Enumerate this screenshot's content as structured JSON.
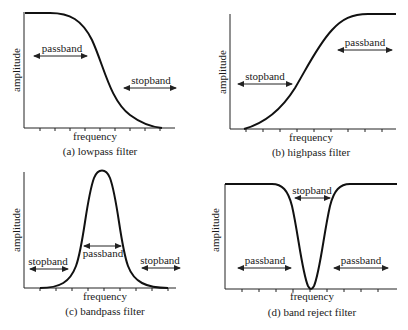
{
  "panels": [
    {
      "id": "a",
      "caption": "(a) lowpass filter",
      "xlabel": "frequency",
      "ylabel": "amplitude",
      "bands": [
        {
          "label": "passband",
          "side": "left"
        },
        {
          "label": "stopband",
          "side": "right"
        }
      ]
    },
    {
      "id": "b",
      "caption": "(b) highpass filter",
      "xlabel": "frequency",
      "ylabel": "amplitude",
      "bands": [
        {
          "label": "stopband",
          "side": "left"
        },
        {
          "label": "passband",
          "side": "right"
        }
      ]
    },
    {
      "id": "c",
      "caption": "(c) bandpass filter",
      "xlabel": "frequency",
      "ylabel": "amplitude",
      "bands": [
        {
          "label": "stopband",
          "side": "left"
        },
        {
          "label": "passband",
          "side": "center"
        },
        {
          "label": "stopband",
          "side": "right"
        }
      ]
    },
    {
      "id": "d",
      "caption": "(d) band reject filter",
      "xlabel": "frequency",
      "ylabel": "amplitude",
      "bands": [
        {
          "label": "passband",
          "side": "left"
        },
        {
          "label": "stopband",
          "side": "center"
        },
        {
          "label": "passband",
          "side": "right"
        }
      ]
    }
  ]
}
